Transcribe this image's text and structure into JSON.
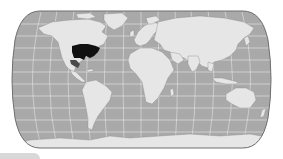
{
  "map": {
    "projection": "robinson-world",
    "style": "grayscale",
    "colors": {
      "ocean": "#a9a9a9",
      "land": "#e6e6e6",
      "graticule": "#f2f2f2",
      "outline": "#6e6e6e",
      "highlight": "#111111",
      "highlight_secondary": "#4a4a4a",
      "background": "#ffffff"
    },
    "highlighted_regions": [
      {
        "name": "Eastern United States",
        "shade": "dark"
      },
      {
        "name": "Mexico (Gulf coast)",
        "shade": "medium"
      }
    ]
  },
  "footer": {
    "tab_color": "#d8d8d8"
  }
}
